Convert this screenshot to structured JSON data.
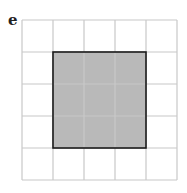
{
  "panel_label": "e",
  "grid": {
    "rows": 5,
    "cols": 5,
    "line_color": "#c8c8c8"
  },
  "shaded_region": {
    "row_start": 1,
    "row_end": 4,
    "col_start": 1,
    "col_end": 4,
    "fill": "#b9b9b9",
    "stroke": "#1a1a1a"
  }
}
